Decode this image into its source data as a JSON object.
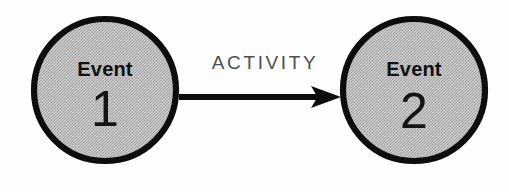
{
  "canvas": {
    "width": 509,
    "height": 192,
    "background": "#fdfdfd"
  },
  "diagram": {
    "type": "activity-on-arrow-network",
    "title": "Event 1 ACTIVITY Event 2",
    "nodes": [
      {
        "id": "event-1",
        "word": "Event",
        "number": "1",
        "cx": 105,
        "cy": 90,
        "r": 71,
        "fill": "#b6b6b6",
        "stroke": "#0d0d0d"
      },
      {
        "id": "event-2",
        "word": "Event",
        "number": "2",
        "cx": 414,
        "cy": 90,
        "r": 71,
        "fill": "#b6b6b6",
        "stroke": "#0d0d0d"
      }
    ],
    "edges": [
      {
        "id": "activity-arrow",
        "label": "ACTIVITY",
        "from": "event-1",
        "to": "event-2",
        "x1": 179,
        "x2": 341,
        "y": 97,
        "label_x": 264,
        "label_y": 69,
        "color": "#0d0d0d",
        "label_color": "#4d4d4d",
        "direction": "left-to-right"
      }
    ]
  }
}
